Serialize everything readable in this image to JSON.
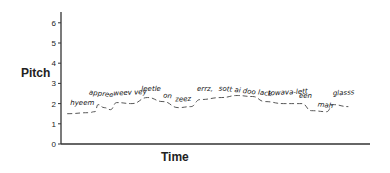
{
  "chart_data": {
    "type": "line",
    "title": "",
    "xlabel": "Time",
    "ylabel": "Pitch",
    "ylim": [
      0,
      6.5
    ],
    "yticks": [
      0,
      1,
      2,
      3,
      4,
      5,
      6
    ],
    "grid": false,
    "legend": null,
    "series": [
      {
        "name": "pitch contour",
        "style": "dashed",
        "points": [
          {
            "x": 0.02,
            "y": 1.5
          },
          {
            "x": 0.09,
            "y": 1.55
          },
          {
            "x": 0.11,
            "y": 1.6
          },
          {
            "x": 0.12,
            "y": 1.95
          },
          {
            "x": 0.14,
            "y": 1.8
          },
          {
            "x": 0.16,
            "y": 1.7
          },
          {
            "x": 0.18,
            "y": 2.05
          },
          {
            "x": 0.23,
            "y": 2.0
          },
          {
            "x": 0.28,
            "y": 2.3
          },
          {
            "x": 0.33,
            "y": 2.1
          },
          {
            "x": 0.38,
            "y": 1.8
          },
          {
            "x": 0.42,
            "y": 1.85
          },
          {
            "x": 0.45,
            "y": 2.2
          },
          {
            "x": 0.52,
            "y": 2.3
          },
          {
            "x": 0.57,
            "y": 2.4
          },
          {
            "x": 0.62,
            "y": 2.35
          },
          {
            "x": 0.66,
            "y": 2.1
          },
          {
            "x": 0.72,
            "y": 2.0
          },
          {
            "x": 0.78,
            "y": 2.0
          },
          {
            "x": 0.81,
            "y": 1.65
          },
          {
            "x": 0.86,
            "y": 1.6
          },
          {
            "x": 0.88,
            "y": 1.95
          },
          {
            "x": 0.93,
            "y": 1.85
          }
        ]
      }
    ],
    "annotations": [
      {
        "text": "hyeem",
        "x": 0.03,
        "y": 1.95
      },
      {
        "text": "appree",
        "x": 0.09,
        "y": 2.45
      },
      {
        "text": "weev vey",
        "x": 0.17,
        "y": 2.4
      },
      {
        "text": "leetle",
        "x": 0.26,
        "y": 2.6
      },
      {
        "text": "on",
        "x": 0.33,
        "y": 2.3
      },
      {
        "text": "zeez",
        "x": 0.37,
        "y": 2.1
      },
      {
        "text": "errz,",
        "x": 0.44,
        "y": 2.6
      },
      {
        "text": "sott ai doo lack",
        "x": 0.51,
        "y": 2.65
      },
      {
        "text": "towava-lett",
        "x": 0.67,
        "y": 2.4
      },
      {
        "text": "een",
        "x": 0.77,
        "y": 2.3
      },
      {
        "text": "mah",
        "x": 0.83,
        "y": 1.85
      },
      {
        "text": "glasss",
        "x": 0.88,
        "y": 2.4
      }
    ]
  },
  "labels": {
    "y_axis": "Pitch",
    "x_axis": "Time",
    "ticks": [
      "0",
      "1",
      "2",
      "3",
      "4",
      "5",
      "6"
    ]
  }
}
